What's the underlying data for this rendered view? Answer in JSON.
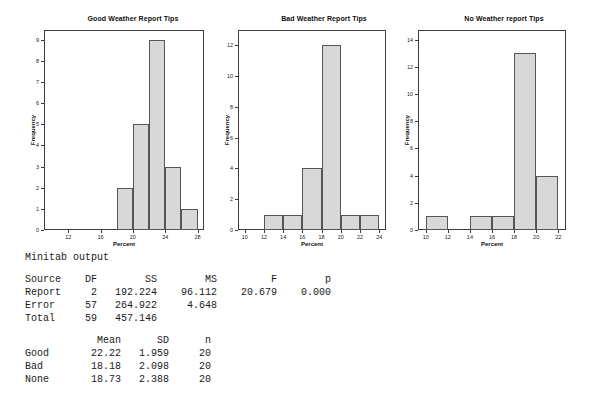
{
  "colors": {
    "bar_fill": "#d8d8d8",
    "bar_border": "#565656",
    "axis": "#3c3c3c",
    "text": "#1a1a1a"
  },
  "chart_data": [
    {
      "type": "bar",
      "title": "Good Weather Report Tips",
      "xlabel": "Percent",
      "ylabel": "Frequency",
      "xlim": [
        9,
        28.8
      ],
      "ylim": [
        0,
        9.45
      ],
      "x_ticks": [
        12,
        16,
        20,
        24,
        28
      ],
      "y_ticks": [
        0,
        1,
        2,
        3,
        4,
        5,
        6,
        7,
        8,
        9
      ],
      "bins": [
        [
          18,
          20
        ],
        [
          20,
          22
        ],
        [
          22,
          24
        ],
        [
          24,
          26
        ],
        [
          26,
          28
        ]
      ],
      "values": [
        2,
        5,
        9,
        3,
        1
      ]
    },
    {
      "type": "bar",
      "title": "Bad Weather Report Tips",
      "xlabel": "Percent",
      "ylabel": "Frequency",
      "xlim": [
        9.3,
        24.7
      ],
      "ylim": [
        0,
        13
      ],
      "x_ticks": [
        10,
        12,
        14,
        16,
        18,
        20,
        22,
        24
      ],
      "y_ticks": [
        0,
        2,
        4,
        6,
        8,
        10,
        12
      ],
      "bins": [
        [
          12,
          14
        ],
        [
          14,
          16
        ],
        [
          16,
          18
        ],
        [
          18,
          20
        ],
        [
          20,
          22
        ],
        [
          22,
          24
        ]
      ],
      "values": [
        1,
        1,
        4,
        12,
        1,
        1
      ]
    },
    {
      "type": "bar",
      "title": "No Weather report Tips",
      "xlabel": "Percent",
      "ylabel": "Frequency",
      "xlim": [
        9.3,
        22.7
      ],
      "ylim": [
        0,
        14.7
      ],
      "x_ticks": [
        10,
        12,
        14,
        16,
        18,
        20,
        22
      ],
      "y_ticks": [
        0,
        2,
        4,
        6,
        8,
        10,
        12,
        14
      ],
      "bins": [
        [
          10,
          12
        ],
        [
          14,
          16
        ],
        [
          16,
          18
        ],
        [
          18,
          20
        ],
        [
          20,
          22
        ]
      ],
      "values": [
        1,
        1,
        1,
        13,
        4
      ]
    }
  ],
  "minitab": {
    "title": "Minitab output",
    "anova": {
      "headers": [
        "Source",
        "DF",
        "SS",
        "MS",
        "F",
        "p"
      ],
      "rows": [
        [
          "Report",
          "2",
          "192.224",
          "96.112",
          "20.679",
          "0.000"
        ],
        [
          "Error",
          "57",
          "264.922",
          "4.648",
          "",
          ""
        ],
        [
          "Total",
          "59",
          "457.146",
          "",
          "",
          ""
        ]
      ]
    },
    "summary": {
      "headers": [
        "",
        "Mean",
        "SD",
        "n"
      ],
      "rows": [
        [
          "Good",
          "22.22",
          "1.959",
          "20"
        ],
        [
          "Bad",
          "18.18",
          "2.098",
          "20"
        ],
        [
          "None",
          "18.73",
          "2.388",
          "20"
        ]
      ]
    }
  }
}
